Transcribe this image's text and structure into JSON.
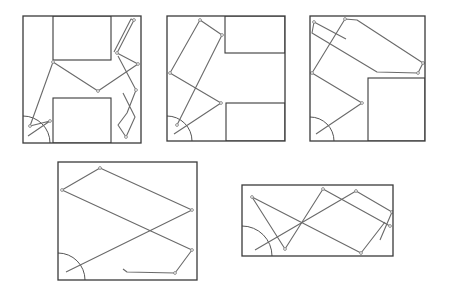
{
  "figure": {
    "colors": {
      "frame": "#3a3a3a",
      "path": "#6a6a6a",
      "background": "#ffffff"
    },
    "panels": [
      {
        "id": "panel-1",
        "frame": [
          23,
          16,
          118,
          127
        ],
        "obstacles": [
          [
            53,
            16,
            58,
            44
          ],
          [
            53,
            98,
            58,
            45
          ]
        ],
        "arc": {
          "cx": 23,
          "cy": 143,
          "r": 27
        },
        "paths": [
          "M30,126 L53,62 L98,91 L138,64 L117,53 L134,20 L131,19 L114,52",
          "M28,136 L50,121 L30,126",
          "M118,56 L136,90 L127,113 L118,125 L126,137 L135,117 L123,93"
        ],
        "nodes": [
          [
            30,
            126
          ],
          [
            53,
            62
          ],
          [
            98,
            91
          ],
          [
            138,
            64
          ],
          [
            117,
            53
          ],
          [
            134,
            20
          ],
          [
            50,
            121
          ],
          [
            136,
            90
          ],
          [
            126,
            137
          ]
        ]
      },
      {
        "id": "panel-2",
        "frame": [
          167,
          16,
          118,
          125
        ],
        "obstacles": [
          [
            225,
            16,
            60,
            37
          ],
          [
            226,
            103,
            59,
            38
          ]
        ],
        "arc": {
          "cx": 167,
          "cy": 141,
          "r": 25
        },
        "paths": [
          "M174,134 L221,103 L170,73 L200,20 L222,35 L177,125"
        ],
        "nodes": [
          [
            221,
            103
          ],
          [
            170,
            73
          ],
          [
            200,
            20
          ],
          [
            222,
            35
          ],
          [
            177,
            125
          ]
        ]
      },
      {
        "id": "panel-3",
        "frame": [
          310,
          16,
          115,
          125
        ],
        "obstacles": [
          [
            368,
            78,
            57,
            63
          ]
        ],
        "arc": {
          "cx": 310,
          "cy": 141,
          "r": 24
        },
        "paths": [
          "M316,134 L362,103 L312,73 L345,19 L357,20 L423,63 L418,73 L377,72 L312,33 L314,22 L346,39"
        ],
        "nodes": [
          [
            362,
            103
          ],
          [
            312,
            73
          ],
          [
            345,
            19
          ],
          [
            423,
            63
          ],
          [
            418,
            73
          ],
          [
            314,
            22
          ]
        ]
      },
      {
        "id": "panel-4",
        "frame": [
          58,
          162,
          139,
          118
        ],
        "obstacles": [],
        "arc": {
          "cx": 58,
          "cy": 280,
          "r": 27
        },
        "paths": [
          "M66,272 L192,210 L100,168 L62,190 L192,250 L175,273 L127,272 L123,269"
        ],
        "nodes": [
          [
            192,
            210
          ],
          [
            100,
            168
          ],
          [
            62,
            190
          ],
          [
            192,
            250
          ],
          [
            175,
            273
          ]
        ]
      },
      {
        "id": "panel-5",
        "frame": [
          242,
          185,
          151,
          71
        ],
        "obstacles": [],
        "arc": {
          "cx": 242,
          "cy": 256,
          "r": 30
        },
        "paths": [
          "M255,250 L356,191 L392,212 L380,240",
          "M252,197 L285,249 L323,189 L390,226",
          "M252,197 L361,253 L385,222"
        ],
        "nodes": [
          [
            252,
            197
          ],
          [
            285,
            249
          ],
          [
            323,
            189
          ],
          [
            356,
            191
          ],
          [
            392,
            212
          ],
          [
            361,
            253
          ],
          [
            390,
            226
          ]
        ]
      }
    ]
  }
}
